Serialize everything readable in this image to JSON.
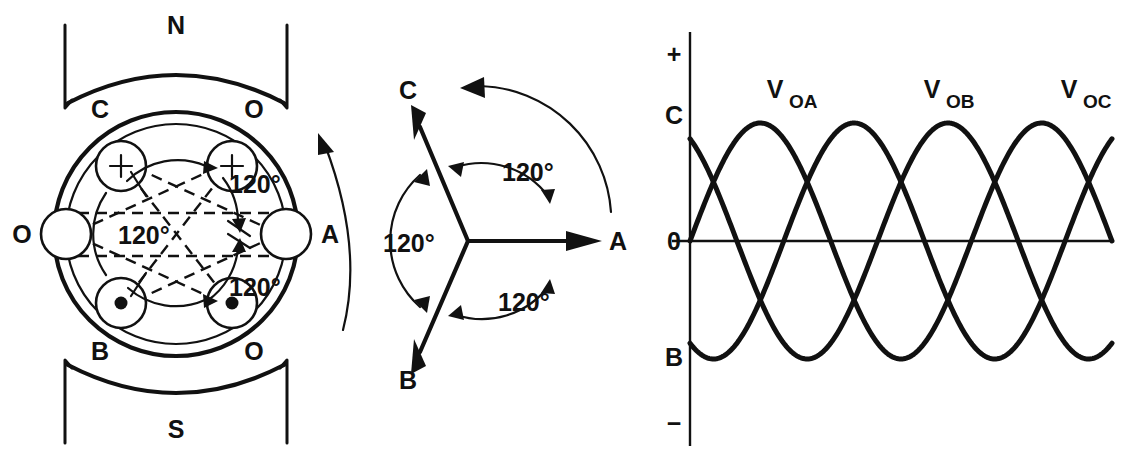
{
  "figure": {
    "background": "#ffffff",
    "ink_color": "#111111"
  },
  "generator": {
    "poles": [
      {
        "name": "north-pole",
        "label": "N",
        "position": "top"
      },
      {
        "name": "south-pole",
        "label": "S",
        "position": "bottom"
      }
    ],
    "terminal_labels": [
      {
        "label": "C",
        "position": "top-left"
      },
      {
        "label": "O",
        "position": "top-right"
      },
      {
        "label": "O",
        "position": "left"
      },
      {
        "label": "A",
        "position": "right"
      },
      {
        "label": "B",
        "position": "bottom-left"
      },
      {
        "label": "O",
        "position": "bottom-right"
      }
    ],
    "coils": [
      {
        "slot": "upper-left",
        "marker": "plus",
        "marker_glyph": "+"
      },
      {
        "slot": "upper-right",
        "marker": "plus",
        "marker_glyph": "+"
      },
      {
        "slot": "left",
        "marker": "none",
        "marker_glyph": ""
      },
      {
        "slot": "right",
        "marker": "none",
        "marker_glyph": ""
      },
      {
        "slot": "lower-left",
        "marker": "dot",
        "marker_glyph": "●"
      },
      {
        "slot": "lower-right",
        "marker": "dot",
        "marker_glyph": "●"
      }
    ],
    "angle_labels": [
      {
        "label": "120°",
        "position": "upper-right-interior"
      },
      {
        "label": "120°",
        "position": "left-interior"
      },
      {
        "label": "120°",
        "position": "lower-right-interior"
      }
    ],
    "rotation": {
      "name": "rotation-arrow",
      "direction": "counterclockwise"
    }
  },
  "phasor": {
    "vectors": [
      {
        "label": "A",
        "angle_deg": 0
      },
      {
        "label": "B",
        "angle_deg": 240
      },
      {
        "label": "C",
        "angle_deg": 120
      }
    ],
    "angle_labels": [
      {
        "label": "120°",
        "between": "C-A"
      },
      {
        "label": "120°",
        "between": "B-C"
      },
      {
        "label": "120°",
        "between": "A-B"
      }
    ],
    "rotation": {
      "name": "rotation-arrow",
      "direction": "counterclockwise"
    }
  },
  "chart_data": {
    "type": "line",
    "title": "",
    "xlabel": "",
    "ylabel": "",
    "x": [
      0,
      15,
      30,
      45,
      60,
      75,
      90,
      105,
      120,
      135,
      150,
      165,
      180,
      195,
      210,
      225,
      240,
      255,
      270,
      285,
      300,
      315,
      330,
      345,
      360,
      375,
      390,
      405,
      420,
      435,
      450,
      465,
      480,
      495,
      510,
      525,
      540
    ],
    "xlim": [
      0,
      540
    ],
    "ylim": [
      -1,
      1
    ],
    "grid": false,
    "legend_position": "inline-above-peaks",
    "y_axis_ticks": [
      {
        "label": "+",
        "value": 1.25,
        "name": "positive-sign"
      },
      {
        "label": "C",
        "value": 0.866,
        "name": "phase-c-start"
      },
      {
        "label": "0",
        "value": 0,
        "name": "zero-line"
      },
      {
        "label": "B",
        "value": -0.866,
        "name": "phase-b-start"
      },
      {
        "label": "−",
        "value": -1.25,
        "name": "negative-sign"
      }
    ],
    "series": [
      {
        "name": "V_OA",
        "label": "V",
        "sublabel": "OA",
        "phase_deg": 0,
        "amplitude": 1.0,
        "label_x": 100
      },
      {
        "name": "V_OB",
        "label": "V",
        "sublabel": "OB",
        "phase_deg": -240,
        "amplitude": 1.0,
        "label_x": 340
      },
      {
        "name": "V_OC",
        "label": "V",
        "sublabel": "OC",
        "phase_deg": -120,
        "amplitude": 1.0,
        "label_x": 500
      }
    ]
  }
}
